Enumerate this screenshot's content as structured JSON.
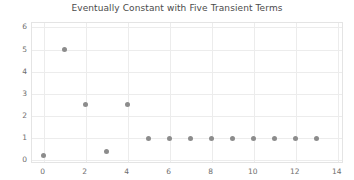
{
  "chart_data": {
    "type": "scatter",
    "title": "Eventually Constant with Five Transient Terms",
    "xlabel": "",
    "ylabel": "",
    "x": [
      0,
      1,
      2,
      3,
      4,
      5,
      6,
      7,
      8,
      9,
      10,
      11,
      12,
      13
    ],
    "values": [
      0.2,
      5,
      2.5,
      0.4,
      2.5,
      1,
      1,
      1,
      1,
      1,
      1,
      1,
      1,
      1
    ],
    "series": [
      {
        "name": "sequence",
        "x": [
          0,
          1,
          2,
          3,
          4,
          5,
          6,
          7,
          8,
          9,
          10,
          11,
          12,
          13
        ],
        "values": [
          0.2,
          5,
          2.5,
          0.4,
          2.5,
          1,
          1,
          1,
          1,
          1,
          1,
          1,
          1,
          1
        ],
        "marker_color": "#8c8c8c"
      }
    ],
    "xlim": [
      -0.55,
      14.3
    ],
    "ylim": [
      -0.17,
      6.2
    ],
    "xticks": [
      0,
      2,
      4,
      6,
      8,
      10,
      12,
      14
    ],
    "yticks": [
      0,
      1,
      2,
      3,
      4,
      5,
      6
    ],
    "xtick_labels": [
      "0",
      "2",
      "4",
      "6",
      "8",
      "10",
      "12",
      "14"
    ],
    "ytick_labels": [
      "0",
      "1",
      "2",
      "3",
      "4",
      "5",
      "6"
    ],
    "grid": true,
    "legend": false,
    "legend_position": "none",
    "annotations": [],
    "transient_count": 5,
    "eventual_constant_value": 1,
    "colors": {
      "marker": "#8c8c8c",
      "grid": "#ececec",
      "frame": "#e4e4e4",
      "title": "#4b4b4b",
      "tick_label": "#6e6e6e",
      "background": "#ffffff"
    }
  }
}
